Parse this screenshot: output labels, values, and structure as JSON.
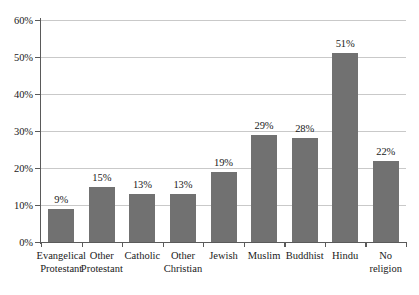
{
  "chart_data": {
    "type": "bar",
    "title": "",
    "subtitle": "",
    "xlabel": "",
    "ylabel": "",
    "ylim": [
      0,
      60
    ],
    "ytick_labels": [
      "0%",
      "10%",
      "20%",
      "30%",
      "40%",
      "50%",
      "60%"
    ],
    "ytick_values": [
      0,
      10,
      20,
      30,
      40,
      50,
      60
    ],
    "grid": true,
    "legend": "none",
    "categories": [
      "Evangelical Protestant",
      "Other Protestant",
      "Catholic",
      "Other Christian",
      "Jewish",
      "Muslim",
      "Buddhist",
      "Hindu",
      "No religion"
    ],
    "category_label_lines": [
      [
        "Evangelical",
        "Protestant"
      ],
      [
        "Other",
        "Protestant"
      ],
      [
        "Catholic",
        ""
      ],
      [
        "Other",
        "Christian"
      ],
      [
        "Jewish",
        ""
      ],
      [
        "Muslim",
        ""
      ],
      [
        "Buddhist",
        ""
      ],
      [
        "Hindu",
        ""
      ],
      [
        "No",
        "religion"
      ]
    ],
    "values": [
      9,
      15,
      13,
      13,
      19,
      29,
      28,
      51,
      22
    ],
    "data_labels": [
      "9%",
      "15%",
      "13%",
      "13%",
      "19%",
      "29%",
      "28%",
      "51%",
      "22%"
    ],
    "colors": {
      "bar": "#717171",
      "gridline": "#c9c9c9",
      "axis": "#5a5a5a",
      "text": "#1a1a1a",
      "background": "#ffffff"
    }
  }
}
